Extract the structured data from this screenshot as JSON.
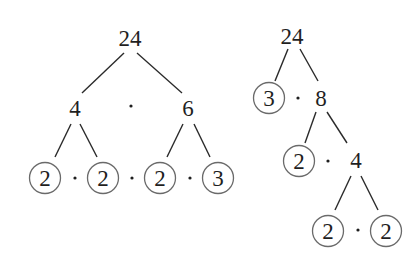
{
  "diagram": {
    "type": "factor-trees",
    "trees": [
      {
        "name": "left-tree",
        "root": "24",
        "level1": [
          "4",
          "6"
        ],
        "leaves": [
          "2",
          "2",
          "2",
          "3"
        ],
        "factorization": "2 · 2 · 2 · 3"
      },
      {
        "name": "right-tree",
        "root": "24",
        "level1": {
          "prime": "3",
          "composite": "8"
        },
        "level2": {
          "prime": "2",
          "composite": "4"
        },
        "level3": [
          "2",
          "2"
        ],
        "circled_primes": [
          "3",
          "2",
          "2",
          "2"
        ]
      }
    ],
    "labels": {
      "t1_root": "24",
      "t1_a": "4",
      "t1_b": "6",
      "t1_l1": "2",
      "t1_l2": "2",
      "t1_l3": "2",
      "t1_l4": "3",
      "t2_root": "24",
      "t2_p1": "3",
      "t2_c1": "8",
      "t2_p2": "2",
      "t2_c2": "4",
      "t2_l1": "2",
      "t2_l2": "2"
    },
    "multiply_symbol": "·",
    "colors": {
      "text": "#1f1f1f",
      "line": "#2a2a2a",
      "circle": "#6a6a6a",
      "background": "#ffffff"
    }
  }
}
